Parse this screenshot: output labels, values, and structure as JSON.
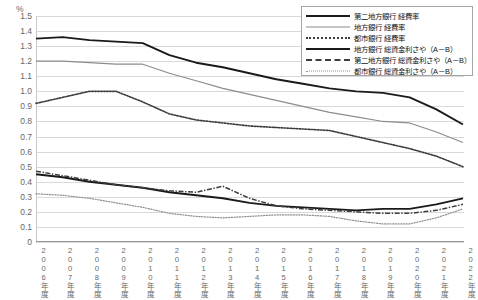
{
  "chart_data": {
    "type": "line",
    "title": "",
    "xlabel": "",
    "ylabel": "%",
    "unit_label": "%",
    "ylim": [
      0,
      1.5
    ],
    "ytick_step": 0.1,
    "grid": true,
    "legend_position": "top-right",
    "categories": [
      "2006年度",
      "2007年度",
      "2008年度",
      "2009年度",
      "2010年度",
      "2011年度",
      "2012年度",
      "2013年度",
      "2014年度",
      "2015年度",
      "2016年度",
      "2017年度",
      "2018年度",
      "2019年度",
      "2020年度",
      "2021年度",
      "2022年度"
    ],
    "ytick_labels": [
      "1.5",
      "1.4",
      "1.3",
      "1.2",
      "1.1",
      "1.0",
      "0.9",
      "0.8",
      "0.7",
      "0.6",
      "0.5",
      "0.4",
      "0.3",
      "0.2",
      "0.1",
      "0"
    ],
    "series": [
      {
        "name": "第二地方銀行 経費率",
        "style": "solid-thick",
        "color": "#1a1a1a",
        "values": [
          1.35,
          1.36,
          1.34,
          1.33,
          1.32,
          1.24,
          1.19,
          1.16,
          1.12,
          1.08,
          1.05,
          1.02,
          1.0,
          0.99,
          0.96,
          0.88,
          0.78
        ]
      },
      {
        "name": "地方銀行 経費率",
        "style": "solid-thin",
        "color": "#8c8c8c",
        "values": [
          1.2,
          1.2,
          1.19,
          1.18,
          1.18,
          1.12,
          1.07,
          1.02,
          0.98,
          0.94,
          0.9,
          0.86,
          0.83,
          0.8,
          0.79,
          0.73,
          0.66
        ]
      },
      {
        "name": "都市銀行 経費率",
        "style": "dotted",
        "color": "#3d3d3d",
        "values": [
          0.92,
          0.96,
          1.0,
          1.0,
          0.93,
          0.85,
          0.81,
          0.79,
          0.77,
          0.76,
          0.75,
          0.74,
          0.7,
          0.66,
          0.62,
          0.57,
          0.5
        ]
      },
      {
        "name": "地方銀行 総資金利さや（A－B）",
        "style": "solid-thick",
        "color": "#1a1a1a",
        "values": [
          0.45,
          0.43,
          0.4,
          0.38,
          0.36,
          0.33,
          0.31,
          0.29,
          0.26,
          0.24,
          0.23,
          0.22,
          0.21,
          0.22,
          0.22,
          0.25,
          0.29
        ]
      },
      {
        "name": "第二地方銀行 総資金利さや（A－B）",
        "style": "dash-dot",
        "color": "#3d3d3d",
        "values": [
          0.47,
          0.44,
          0.41,
          0.38,
          0.36,
          0.34,
          0.33,
          0.37,
          0.29,
          0.24,
          0.22,
          0.21,
          0.2,
          0.19,
          0.19,
          0.21,
          0.25
        ]
      },
      {
        "name": "都市銀行 総資金利さや（A－B）",
        "style": "fine-dot",
        "color": "#8f8f8f",
        "values": [
          0.32,
          0.31,
          0.29,
          0.26,
          0.23,
          0.19,
          0.17,
          0.16,
          0.17,
          0.18,
          0.18,
          0.17,
          0.14,
          0.12,
          0.12,
          0.16,
          0.22
        ]
      }
    ]
  },
  "legend": {
    "items": [
      {
        "label": "第二地方銀行 経費率"
      },
      {
        "label": "地方銀行 経費率"
      },
      {
        "label": "都市銀行 経費率"
      },
      {
        "label": "地方銀行 総資金利さや（A－B）"
      },
      {
        "label": "第二地方銀行 総資金利さや（A－B）"
      },
      {
        "label": "都市銀行 総資金利さや（A－B）"
      }
    ]
  }
}
